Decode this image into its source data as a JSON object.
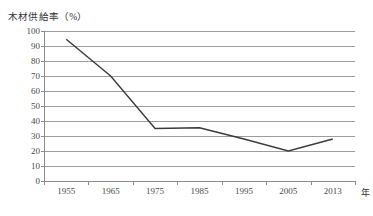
{
  "chart_data": {
    "type": "line",
    "title": "木材供給率（%）",
    "xlabel": "年",
    "ylabel": "木材供給率（%）",
    "categories": [
      "1955",
      "1965",
      "1975",
      "1985",
      "1995",
      "2005",
      "2013"
    ],
    "values": [
      94.5,
      70,
      35,
      35.5,
      28,
      20,
      28
    ],
    "series": [
      {
        "name": "木材供給率",
        "values": [
          94.5,
          70,
          35,
          35.5,
          28,
          20,
          28
        ]
      }
    ],
    "ylim": [
      0,
      100
    ],
    "ytick_labels": [
      "100",
      "90",
      "80",
      "70",
      "60",
      "50",
      "40",
      "30",
      "20",
      "10",
      "0"
    ],
    "ytick_values": [
      100,
      90,
      80,
      70,
      60,
      50,
      40,
      30,
      20,
      10,
      0
    ],
    "grid": true,
    "legend": false,
    "line_color": "#3b3b3b",
    "grid_color": "#9d9d9d",
    "axis_color": "#8c8c8c",
    "background_color": "#ffffff"
  }
}
